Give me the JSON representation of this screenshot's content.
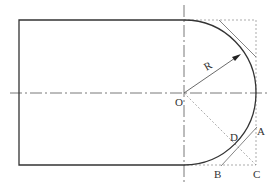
{
  "diagram": {
    "type": "engineering-drawing",
    "colors": {
      "outline": "#333333",
      "construction": "#888888",
      "centerline": "#555555"
    },
    "labels": {
      "radius": "R",
      "center": "O",
      "point_a": "A",
      "point_b": "B",
      "point_c": "C",
      "point_d": "D"
    }
  }
}
